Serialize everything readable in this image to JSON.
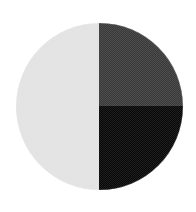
{
  "figure": {
    "name": "quadrant-disc",
    "background_color": "#ffffff",
    "canvas": {
      "width": 196,
      "height": 212
    },
    "circle": {
      "center_x": 99,
      "center_y": 106,
      "diameter": 167,
      "radius": 83.5
    },
    "texture": "checkerboard-dither",
    "quadrants": [
      {
        "id": "top-left",
        "label": "Top Left",
        "color": "#e2e2e2",
        "tone": "light-gray"
      },
      {
        "id": "top-right",
        "label": "Top Right",
        "color": "#3a3a3a",
        "tone": "dark-gray"
      },
      {
        "id": "bottom-left",
        "label": "Bottom Left",
        "color": "#e2e2e2",
        "tone": "light-gray"
      },
      {
        "id": "bottom-right",
        "label": "Bottom Right",
        "color": "#080808",
        "tone": "black"
      }
    ]
  }
}
